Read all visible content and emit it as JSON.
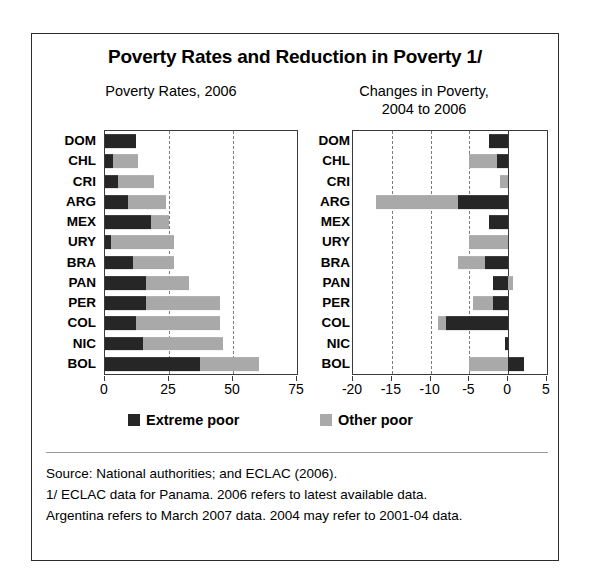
{
  "figure": {
    "title": "Poverty Rates and Reduction in Poverty 1/",
    "left_subtitle": "Poverty Rates, 2006",
    "right_subtitle": "Changes in Poverty,\n2004 to 2006",
    "right_subtitle_line1": "Changes in Poverty,",
    "right_subtitle_line2": "2004 to 2006"
  },
  "legend": {
    "extreme_label": "Extreme poor",
    "other_label": "Other poor",
    "extreme_color": "#262626",
    "other_color": "#a9a9a9"
  },
  "footnotes": [
    "Source: National authorities; and ECLAC (2006).",
    "1/ ECLAC data for Panama. 2006 refers to latest available data.",
    "Argentina refers to March 2007  data. 2004 may refer to 2001-04 data."
  ],
  "chart_data": [
    {
      "id": "poverty-rates",
      "type": "bar",
      "orientation": "horizontal",
      "stacked": true,
      "title": "Poverty Rates, 2006",
      "xlabel": "",
      "ylabel": "",
      "xlim": [
        0,
        75
      ],
      "xticks": [
        0,
        25,
        50,
        75
      ],
      "xtick_labels": [
        "0",
        "25",
        "50",
        "75"
      ],
      "gridlines": [
        25,
        50
      ],
      "grid": true,
      "legend_position": "below",
      "categories": [
        "DOM",
        "CHL",
        "CRI",
        "ARG",
        "MEX",
        "URY",
        "BRA",
        "PAN",
        "PER",
        "COL",
        "NIC",
        "BOL"
      ],
      "series": [
        {
          "name": "Extreme poor",
          "color": "#262626",
          "values": [
            12.0,
            3.2,
            5.0,
            9.0,
            18.0,
            2.2,
            11.0,
            16.0,
            16.0,
            12.0,
            15.0,
            37.0
          ]
        },
        {
          "name": "Other poor",
          "color": "#a9a9a9",
          "values": [
            0.0,
            9.8,
            14.0,
            15.0,
            7.0,
            24.8,
            16.0,
            17.0,
            29.0,
            33.0,
            31.0,
            23.0
          ]
        }
      ],
      "totals": [
        12.0,
        13.0,
        19.0,
        24.0,
        25.0,
        27.0,
        27.0,
        33.0,
        45.0,
        45.0,
        46.0,
        60.0
      ]
    },
    {
      "id": "changes-in-poverty",
      "type": "bar",
      "orientation": "horizontal",
      "stacked": true,
      "title": "Changes in Poverty, 2004 to 2006",
      "xlabel": "",
      "ylabel": "",
      "xlim": [
        -20,
        5
      ],
      "xticks": [
        -20,
        -15,
        -10,
        -5,
        0,
        5
      ],
      "xtick_labels": [
        "-20",
        "-15",
        "-10",
        "-5",
        "0",
        "5"
      ],
      "gridlines": [
        -15,
        -10,
        -5
      ],
      "zero_line": 0,
      "grid": true,
      "legend_position": "below",
      "categories": [
        "DOM",
        "CHL",
        "CRI",
        "ARG",
        "MEX",
        "URY",
        "BRA",
        "PAN",
        "PER",
        "COL",
        "NIC",
        "BOL"
      ],
      "series": [
        {
          "name": "Extreme poor",
          "color": "#262626",
          "values": [
            -2.5,
            -1.5,
            0.0,
            -6.5,
            -2.5,
            0.0,
            -3.0,
            -2.0,
            -2.0,
            -8.0,
            -0.4,
            2.0
          ]
        },
        {
          "name": "Other poor",
          "color": "#a9a9a9",
          "values": [
            0.0,
            -3.5,
            -1.1,
            -10.5,
            0.0,
            -5.0,
            -3.5,
            0.6,
            -2.5,
            -1.0,
            0.0,
            -5.0
          ]
        }
      ],
      "totals": [
        -2.5,
        -5.0,
        -1.1,
        -17.0,
        -2.5,
        -5.0,
        -6.5,
        -1.4,
        -4.5,
        -9.0,
        -0.4,
        -3.0
      ]
    }
  ]
}
